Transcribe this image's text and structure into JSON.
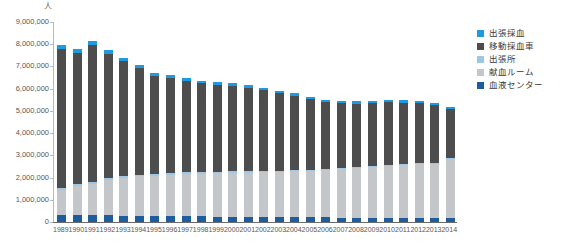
{
  "chart_data": {
    "type": "bar",
    "stacked": true,
    "title": "",
    "subtitle": "",
    "xlabel": "",
    "ylabel": "人",
    "unit_caption": "人",
    "ylim": [
      0,
      9000000
    ],
    "ytick_step": 1000000,
    "ytick_labels": [
      "9,000,000",
      "8,000,000",
      "7,000,000",
      "6,000,000",
      "5,000,000",
      "4,000,000",
      "3,000,000",
      "2,000,000",
      "1,000,000",
      "0"
    ],
    "ytick_values": [
      9000000,
      8000000,
      7000000,
      6000000,
      5000000,
      4000000,
      3000000,
      2000000,
      1000000,
      0
    ],
    "grid": false,
    "legend_position": "right",
    "categories": [
      "1989",
      "1990",
      "1991",
      "1992",
      "1993",
      "1994",
      "1995",
      "1996",
      "1997",
      "1998",
      "1999",
      "2000",
      "2001",
      "2002",
      "2003",
      "2004",
      "2005",
      "2006",
      "2007",
      "2008",
      "2009",
      "2010",
      "2011",
      "2012",
      "2013",
      "2014"
    ],
    "series": [
      {
        "name": "血液センター",
        "color": "#1f5c9e",
        "stack_order": 0,
        "values": [
          300000,
          300000,
          310000,
          300000,
          290000,
          280000,
          270000,
          260000,
          250000,
          250000,
          240000,
          240000,
          230000,
          230000,
          220000,
          220000,
          210000,
          210000,
          200000,
          200000,
          200000,
          200000,
          200000,
          200000,
          190000,
          190000
        ]
      },
      {
        "name": "献血ルーム",
        "color": "#c4c7c9",
        "stack_order": 1,
        "values": [
          1150000,
          1300000,
          1420000,
          1580000,
          1700000,
          1770000,
          1820000,
          1860000,
          1900000,
          1930000,
          1950000,
          1970000,
          1990000,
          2010000,
          2030000,
          2060000,
          2090000,
          2130000,
          2170000,
          2220000,
          2280000,
          2330000,
          2380000,
          2410000,
          2430000,
          2630000
        ]
      },
      {
        "name": "出張所",
        "color": "#9ec6e6",
        "stack_order": 2,
        "values": [
          90000,
          90000,
          90000,
          90000,
          85000,
          85000,
          80000,
          80000,
          80000,
          75000,
          75000,
          70000,
          70000,
          65000,
          65000,
          60000,
          60000,
          55000,
          55000,
          50000,
          50000,
          50000,
          45000,
          45000,
          45000,
          40000
        ]
      },
      {
        "name": "移動採血車",
        "color": "#4d4d4d",
        "stack_order": 3,
        "values": [
          6230000,
          5910000,
          6150000,
          5590000,
          5160000,
          4800000,
          4400000,
          4280000,
          4100000,
          3980000,
          3910000,
          3840000,
          3740000,
          3620000,
          3480000,
          3340000,
          3160000,
          3010000,
          2920000,
          2860000,
          2830000,
          2800000,
          2750000,
          2680000,
          2590000,
          2230000
        ]
      },
      {
        "name": "出張採血",
        "color": "#1f9ae0",
        "stack_order": 4,
        "values": [
          200000,
          180000,
          190000,
          170000,
          160000,
          150000,
          150000,
          140000,
          140000,
          130000,
          130000,
          120000,
          120000,
          120000,
          110000,
          110000,
          110000,
          100000,
          100000,
          100000,
          100000,
          100000,
          95000,
          95000,
          90000,
          85000
        ]
      }
    ],
    "totals": [
      7970000,
      7780000,
      8160000,
      7730000,
      7395000,
      7085000,
      6720000,
      6620000,
      6470000,
      6365000,
      6305000,
      6240000,
      6150000,
      6045000,
      5905000,
      5790000,
      5630000,
      5505000,
      5445000,
      5430000,
      5460000,
      5480000,
      5470000,
      5430000,
      5345000,
      5175000
    ]
  },
  "legend": {
    "items": [
      {
        "label": "出張採血",
        "color": "#1f9ae0"
      },
      {
        "label": "移動採血車",
        "color": "#4d4d4d"
      },
      {
        "label": "出張所",
        "color": "#9ec6e6"
      },
      {
        "label": "献血ルーム",
        "color": "#c4c7c9"
      },
      {
        "label": "血液センター",
        "color": "#1f5c9e"
      }
    ]
  },
  "axes": {
    "y_unit": "人"
  }
}
